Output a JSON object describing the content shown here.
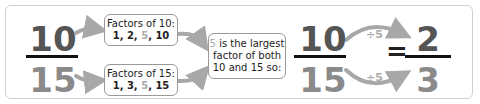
{
  "left_fraction": {
    "numerator": "10",
    "denominator": "15"
  },
  "factor_boxes": [
    {
      "title": "Factors of 10:",
      "factors": [
        "1, 2, ",
        "5",
        ", 10"
      ]
    },
    {
      "title": "Factors of 15:",
      "factors": [
        "1, 3, ",
        "5",
        ", 15"
      ]
    }
  ],
  "conclusion_box": {
    "highlight": "5",
    "line1_rest": " is the largest",
    "line2": "factor of both",
    "line3": "10 and 15 so:"
  },
  "right_equation": {
    "left": {
      "numerator": "10",
      "denominator": "15"
    },
    "equals": "=",
    "operation_top": "÷5",
    "operation_bottom": "÷5",
    "result": {
      "numerator": "2",
      "denominator": "3"
    }
  },
  "colors": {
    "numerator": "#555555",
    "denominator": "#8a8a8a",
    "highlight": "#aaaaaa",
    "arrow": "#a8a8a8"
  }
}
